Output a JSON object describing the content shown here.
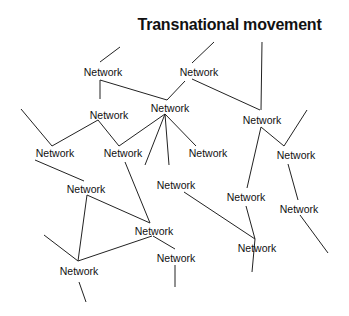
{
  "title": "Transnational movement",
  "nodes": [
    {
      "id": "n1",
      "label": "Network",
      "x": 103,
      "y": 72
    },
    {
      "id": "n2",
      "label": "Network",
      "x": 199,
      "y": 72
    },
    {
      "id": "n3",
      "label": "Network",
      "x": 109,
      "y": 115
    },
    {
      "id": "n4",
      "label": "Network",
      "x": 170,
      "y": 108
    },
    {
      "id": "n5",
      "label": "Network",
      "x": 262,
      "y": 120
    },
    {
      "id": "n6",
      "label": "Network",
      "x": 55,
      "y": 153
    },
    {
      "id": "n7",
      "label": "Network",
      "x": 123,
      "y": 153
    },
    {
      "id": "n8",
      "label": "Network",
      "x": 208,
      "y": 153
    },
    {
      "id": "n9",
      "label": "Network",
      "x": 296,
      "y": 155
    },
    {
      "id": "n10",
      "label": "Network",
      "x": 86,
      "y": 189
    },
    {
      "id": "n11",
      "label": "Network",
      "x": 176,
      "y": 185
    },
    {
      "id": "n12",
      "label": "Network",
      "x": 246,
      "y": 197
    },
    {
      "id": "n13",
      "label": "Network",
      "x": 299,
      "y": 209
    },
    {
      "id": "n14",
      "label": "Network",
      "x": 154,
      "y": 231
    },
    {
      "id": "n15",
      "label": "Network",
      "x": 257,
      "y": 248
    },
    {
      "id": "n16",
      "label": "Network",
      "x": 79,
      "y": 271
    },
    {
      "id": "n17",
      "label": "Network",
      "x": 176,
      "y": 258
    }
  ],
  "edges": [
    [
      100,
      62,
      120,
      47
    ],
    [
      100,
      80,
      100,
      99
    ],
    [
      100,
      80,
      167,
      100
    ],
    [
      192,
      63,
      214,
      42
    ],
    [
      192,
      79,
      260,
      110
    ],
    [
      261,
      110,
      262,
      42
    ],
    [
      167,
      100,
      185,
      81
    ],
    [
      98,
      120,
      52,
      146
    ],
    [
      52,
      146,
      21,
      109
    ],
    [
      98,
      120,
      119,
      146
    ],
    [
      119,
      146,
      165,
      114
    ],
    [
      165,
      114,
      145,
      165
    ],
    [
      165,
      114,
      196,
      146
    ],
    [
      165,
      114,
      169,
      165
    ],
    [
      261,
      127,
      284,
      146
    ],
    [
      284,
      146,
      307,
      110
    ],
    [
      261,
      127,
      247,
      188
    ],
    [
      288,
      164,
      298,
      200
    ],
    [
      300,
      215,
      328,
      253
    ],
    [
      35,
      160,
      84,
      181
    ],
    [
      87,
      195,
      150,
      223
    ],
    [
      87,
      195,
      78,
      261
    ],
    [
      125,
      162,
      150,
      223
    ],
    [
      78,
      261,
      44,
      235
    ],
    [
      78,
      261,
      152,
      236
    ],
    [
      184,
      192,
      255,
      239
    ],
    [
      246,
      206,
      255,
      239
    ],
    [
      255,
      239,
      252,
      272
    ],
    [
      153,
      236,
      175,
      249
    ],
    [
      175,
      265,
      175,
      287
    ],
    [
      79,
      282,
      86,
      302
    ]
  ]
}
